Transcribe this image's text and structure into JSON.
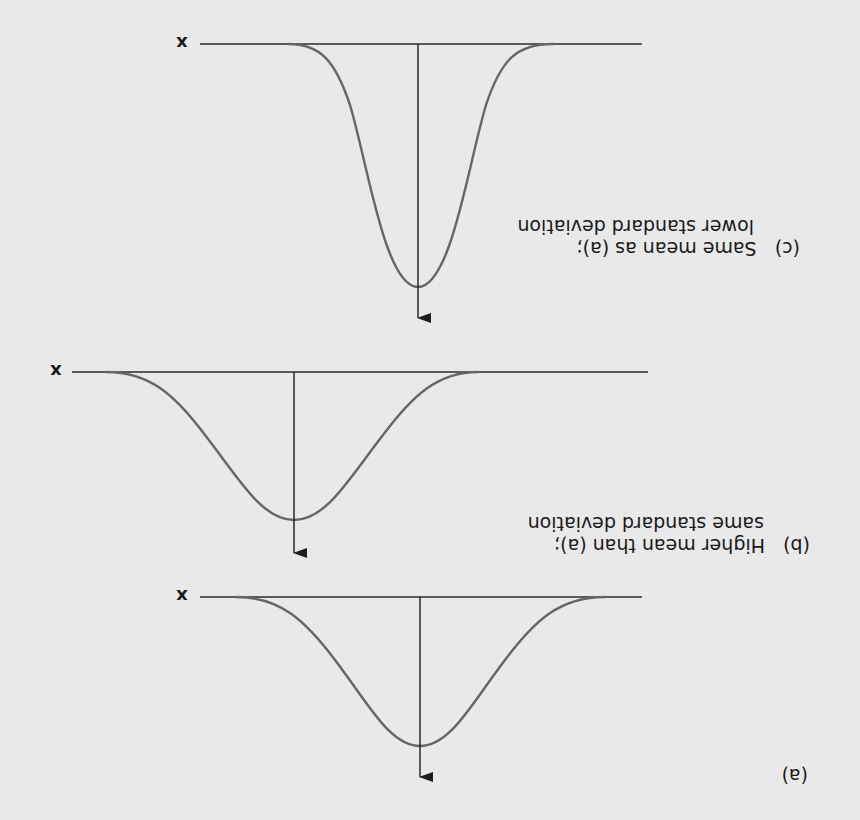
{
  "figure": {
    "orientation": "rotated 180 degrees",
    "background": "#e9e9e9",
    "axis_color": "#2b2b2b",
    "curve_color": "#666666",
    "axis_label": "x"
  },
  "panels": [
    {
      "id": "a",
      "caption_tag": "(a)",
      "caption_lines": [],
      "description": "Reference normal distribution"
    },
    {
      "id": "b",
      "caption_tag": "(b)",
      "caption_lines": [
        "Higher mean than (a);",
        "same standard deviation"
      ]
    },
    {
      "id": "c",
      "caption_tag": "(c)",
      "caption_lines": [
        "Same mean as (a);",
        "lower standard deviation"
      ]
    }
  ],
  "labels": {
    "a_tag": "(a)",
    "b_tag": "(b)",
    "b_line1": "Higher mean than (a);",
    "b_line2": "same standard deviation",
    "c_tag": "(c)",
    "c_line1": "Same mean as (a);",
    "c_line2": "lower standard deviation",
    "x_a": "x",
    "x_b": "x",
    "x_c": "x"
  }
}
